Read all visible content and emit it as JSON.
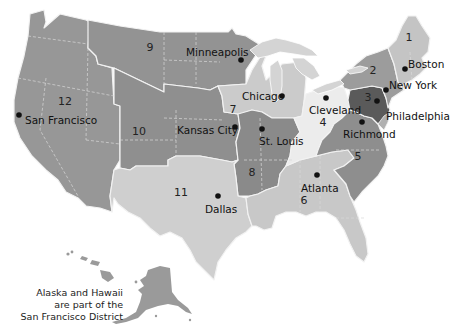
{
  "map": {
    "title": "Federal Reserve Districts",
    "colors": {
      "d1": "#c4c4c4",
      "d2": "#9c9c9c",
      "d3": "#5a5a5a",
      "d4": "#ececec",
      "d5": "#8e8e8e",
      "d6": "#c8c8c8",
      "d7": "#cbcbcb",
      "d8": "#8a8a8a",
      "d9": "#939393",
      "d10": "#8f8f8f",
      "d11": "#cfcfcf",
      "d12": "#979797",
      "background": "#ffffff"
    },
    "districts": [
      {
        "number": "1",
        "city": "Boston"
      },
      {
        "number": "2",
        "city": "New York"
      },
      {
        "number": "3",
        "city": "Philadelphia"
      },
      {
        "number": "4",
        "city": "Cleveland"
      },
      {
        "number": "5",
        "city": "Richmond"
      },
      {
        "number": "6",
        "city": "Atlanta"
      },
      {
        "number": "7",
        "city": "Chicago"
      },
      {
        "number": "8",
        "city": "St. Louis"
      },
      {
        "number": "9",
        "city": "Minneapolis"
      },
      {
        "number": "10",
        "city": "Kansas City"
      },
      {
        "number": "11",
        "city": "Dallas"
      },
      {
        "number": "12",
        "city": "San Francisco"
      }
    ],
    "note": {
      "line1": "Alaska and Hawaii",
      "line2": "are part of the",
      "line3": "San Francisco District"
    }
  }
}
